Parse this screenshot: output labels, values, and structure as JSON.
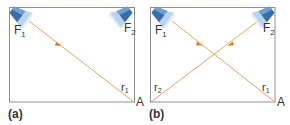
{
  "colors": {
    "frame": "#8a8f99",
    "ray": "#e8a25a",
    "arrow": "#e07a2a",
    "lamp_body": "#3a6ea8",
    "lamp_light": "#b9d4ee",
    "text": "#333333"
  },
  "panels": [
    {
      "id": "a",
      "caption": "(a)",
      "source_labels": {
        "f1": "F",
        "f1_sub": "1",
        "f2": "F",
        "f2_sub": "2"
      },
      "ray_labels": [
        {
          "text": "r",
          "sub": "1"
        }
      ],
      "point_label": "A"
    },
    {
      "id": "b",
      "caption": "(b)",
      "source_labels": {
        "f1": "F",
        "f1_sub": "1",
        "f2": "F",
        "f2_sub": "2"
      },
      "ray_labels": [
        {
          "text": "r",
          "sub": "1"
        },
        {
          "text": "r",
          "sub": "2"
        }
      ],
      "point_label": "A"
    }
  ]
}
